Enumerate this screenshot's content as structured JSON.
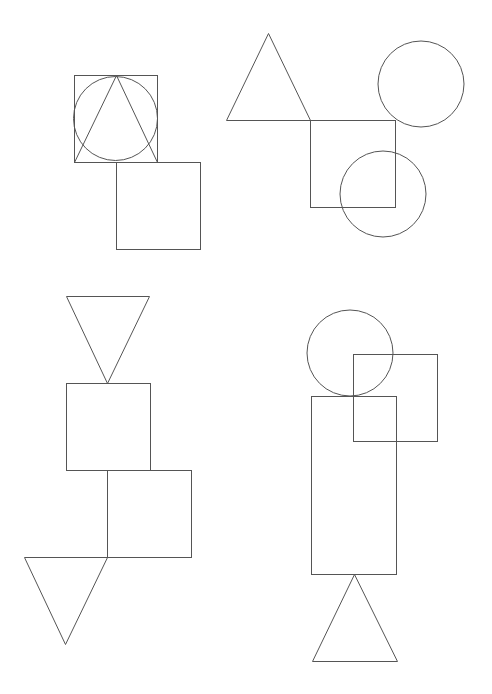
{
  "canvas": {
    "width": 492,
    "height": 694,
    "background": "#ffffff",
    "stroke": "#555555",
    "stroke_width": 1
  },
  "groups": [
    {
      "name": "group-top-left",
      "shapes": [
        {
          "type": "rect",
          "name": "square-a",
          "x": 74,
          "y": 75,
          "w": 83,
          "h": 87
        },
        {
          "type": "circle",
          "name": "circle-a",
          "cx": 115.5,
          "cy": 118.5,
          "r": 42
        },
        {
          "type": "polygon",
          "name": "triangle-a",
          "points": [
            [
              116,
              75
            ],
            [
              74,
              162
            ],
            [
              157,
              162
            ]
          ]
        },
        {
          "type": "rect",
          "name": "square-b",
          "x": 116,
          "y": 162,
          "w": 84,
          "h": 87
        }
      ]
    },
    {
      "name": "group-top-right",
      "shapes": [
        {
          "type": "polygon",
          "name": "triangle-b",
          "points": [
            [
              268,
              33
            ],
            [
              226,
              120
            ],
            [
              310,
              120
            ]
          ]
        },
        {
          "type": "rect",
          "name": "square-c",
          "x": 310,
          "y": 120,
          "w": 85,
          "h": 87
        },
        {
          "type": "circle",
          "name": "circle-b",
          "cx": 421,
          "cy": 84,
          "r": 43
        },
        {
          "type": "circle",
          "name": "circle-c",
          "cx": 383,
          "cy": 194,
          "r": 43
        }
      ]
    },
    {
      "name": "group-bottom-left",
      "shapes": [
        {
          "type": "polygon",
          "name": "triangle-inverted-a",
          "points": [
            [
              66,
              296
            ],
            [
              149,
              296
            ],
            [
              107,
              383
            ]
          ]
        },
        {
          "type": "rect",
          "name": "square-d",
          "x": 66,
          "y": 383,
          "w": 84,
          "h": 87
        },
        {
          "type": "rect",
          "name": "square-e",
          "x": 107,
          "y": 470,
          "w": 84,
          "h": 87
        },
        {
          "type": "polygon",
          "name": "triangle-inverted-b",
          "points": [
            [
              24,
              557
            ],
            [
              107,
              557
            ],
            [
              65,
              644
            ]
          ]
        }
      ]
    },
    {
      "name": "group-bottom-right",
      "shapes": [
        {
          "type": "circle",
          "name": "circle-d",
          "cx": 350,
          "cy": 353,
          "r": 43
        },
        {
          "type": "rect",
          "name": "square-f",
          "x": 353,
          "y": 354,
          "w": 84,
          "h": 87
        },
        {
          "type": "rect",
          "name": "rectangle-tall",
          "x": 311,
          "y": 396,
          "w": 85,
          "h": 178
        },
        {
          "type": "polygon",
          "name": "triangle-c",
          "points": [
            [
              354,
              574
            ],
            [
              312,
              661
            ],
            [
              397,
              661
            ]
          ]
        }
      ]
    }
  ]
}
